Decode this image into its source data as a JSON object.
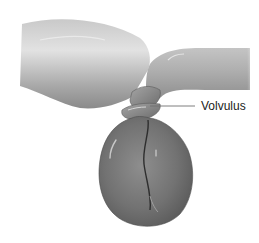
{
  "figure": {
    "style": "grayscale medical illustration",
    "labels": [
      {
        "text": "Volvulus",
        "leader_line": true
      }
    ],
    "colors": {
      "background": "#ffffff",
      "tissue_light": "#d6d6d6",
      "tissue_mid": "#9a9a9a",
      "tissue_dark": "#5e5e5e",
      "leader_line": "#707070",
      "label_text": "#222222"
    }
  }
}
